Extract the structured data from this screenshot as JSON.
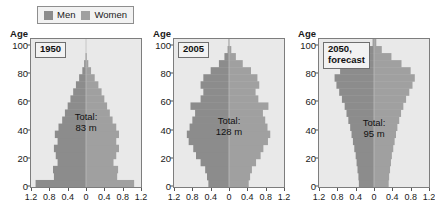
{
  "legend": {
    "entries": [
      {
        "label": "Men",
        "color": "#8c8c8c",
        "key": "men"
      },
      {
        "label": "Women",
        "color": "#a0a0a0",
        "key": "women"
      }
    ]
  },
  "axes": {
    "y_label": "Age",
    "y_ticks": [
      "0",
      "20",
      "40",
      "60",
      "80",
      "100"
    ],
    "x_ticks": [
      "1.2",
      "0.8",
      "0.4",
      "0",
      "0.4",
      "0.8",
      "1.2"
    ]
  },
  "panels": [
    {
      "title": "1950",
      "total": "Total:\n83 m"
    },
    {
      "title": "2005",
      "total": "Total:\n128 m"
    },
    {
      "title": "2050,\nforecast",
      "total": "Total:\n95 m"
    }
  ],
  "chart_data": {
    "type": "bar",
    "orientation": "horizontal-bidirectional",
    "xlabel": "",
    "ylabel": "Age",
    "ylim": [
      0,
      105
    ],
    "xlim": [
      -1.2,
      1.2
    ],
    "x_unit": "millions per 5-year age group",
    "x_ticks": [
      1.2,
      0.8,
      0.4,
      0,
      0.4,
      0.8,
      1.2
    ],
    "y_ticks": [
      0,
      20,
      40,
      60,
      80,
      100
    ],
    "grid": false,
    "legend_position": "top",
    "series_names": [
      "Men",
      "Women"
    ],
    "age_bins": [
      0,
      5,
      10,
      15,
      20,
      25,
      30,
      35,
      40,
      45,
      50,
      55,
      60,
      65,
      70,
      75,
      80,
      85,
      90,
      95,
      100
    ],
    "panels": [
      {
        "name": "1950",
        "total_label": "Total: 83 m",
        "total_millions": 83,
        "men": [
          1.1,
          0.7,
          0.72,
          0.62,
          0.66,
          0.7,
          0.62,
          0.68,
          0.6,
          0.52,
          0.46,
          0.4,
          0.34,
          0.28,
          0.22,
          0.15,
          0.08,
          0.04,
          0.01,
          0.0,
          0.0
        ],
        "women": [
          1.05,
          0.68,
          0.7,
          0.6,
          0.66,
          0.72,
          0.66,
          0.72,
          0.66,
          0.58,
          0.52,
          0.46,
          0.4,
          0.34,
          0.27,
          0.19,
          0.11,
          0.05,
          0.02,
          0.0,
          0.0
        ]
      },
      {
        "name": "2005",
        "total_label": "Total: 128 m",
        "total_millions": 128,
        "men": [
          0.45,
          0.48,
          0.52,
          0.62,
          0.72,
          0.78,
          0.88,
          0.92,
          0.86,
          0.8,
          0.74,
          0.84,
          0.62,
          0.56,
          0.62,
          0.56,
          0.4,
          0.22,
          0.1,
          0.03,
          0.01
        ],
        "women": [
          0.43,
          0.46,
          0.5,
          0.59,
          0.69,
          0.75,
          0.85,
          0.9,
          0.84,
          0.79,
          0.74,
          0.86,
          0.64,
          0.58,
          0.66,
          0.62,
          0.48,
          0.3,
          0.15,
          0.05,
          0.01
        ]
      },
      {
        "name": "2050, forecast",
        "total_label": "Total: 95 m",
        "total_millions": 95,
        "men": [
          0.33,
          0.34,
          0.36,
          0.38,
          0.4,
          0.43,
          0.46,
          0.49,
          0.52,
          0.56,
          0.6,
          0.64,
          0.7,
          0.76,
          0.82,
          0.86,
          0.74,
          0.52,
          0.3,
          0.12,
          0.03
        ],
        "women": [
          0.32,
          0.33,
          0.35,
          0.37,
          0.39,
          0.42,
          0.45,
          0.48,
          0.51,
          0.55,
          0.59,
          0.64,
          0.7,
          0.77,
          0.84,
          0.89,
          0.8,
          0.6,
          0.38,
          0.17,
          0.05
        ]
      }
    ]
  }
}
